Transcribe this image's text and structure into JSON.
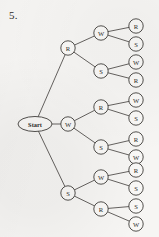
{
  "problem": {
    "number": "5."
  },
  "diagram": {
    "type": "probability-tree",
    "root": {
      "label": "Start",
      "shape": "ellipse",
      "cx": 35,
      "cy": 124,
      "rx": 17,
      "ry": 7.5
    },
    "node_radius": 7.2,
    "levels": [
      {
        "name": "level-1",
        "nodes": [
          {
            "id": "l1-r",
            "label": "R",
            "cx": 68,
            "cy": 48
          },
          {
            "id": "l1-w",
            "label": "W",
            "cx": 68,
            "cy": 124
          },
          {
            "id": "l1-s",
            "label": "S",
            "cx": 68,
            "cy": 193
          }
        ]
      },
      {
        "name": "level-2",
        "nodes": [
          {
            "id": "l2-a",
            "label": "W",
            "cx": 101,
            "cy": 33,
            "parent": "l1-r"
          },
          {
            "id": "l2-b",
            "label": "S",
            "cx": 101,
            "cy": 71,
            "parent": "l1-r"
          },
          {
            "id": "l2-c",
            "label": "R",
            "cx": 101,
            "cy": 107,
            "parent": "l1-w"
          },
          {
            "id": "l2-d",
            "label": "S",
            "cx": 101,
            "cy": 147,
            "parent": "l1-w"
          },
          {
            "id": "l2-e",
            "label": "W",
            "cx": 101,
            "cy": 177,
            "parent": "l1-s"
          },
          {
            "id": "l2-f",
            "label": "R",
            "cx": 101,
            "cy": 209,
            "parent": "l1-s"
          }
        ]
      },
      {
        "name": "level-3",
        "nodes": [
          {
            "id": "l3-01",
            "label": "R",
            "cx": 136,
            "cy": 26,
            "parent": "l2-a"
          },
          {
            "id": "l3-02",
            "label": "S",
            "cx": 136,
            "cy": 44,
            "parent": "l2-a"
          },
          {
            "id": "l3-03",
            "label": "W",
            "cx": 136,
            "cy": 62,
            "parent": "l2-b"
          },
          {
            "id": "l3-04",
            "label": "R",
            "cx": 136,
            "cy": 80,
            "parent": "l2-b"
          },
          {
            "id": "l3-05",
            "label": "W",
            "cx": 136,
            "cy": 100,
            "parent": "l2-c"
          },
          {
            "id": "l3-06",
            "label": "S",
            "cx": 136,
            "cy": 118,
            "parent": "l2-c"
          },
          {
            "id": "l3-07",
            "label": "R",
            "cx": 136,
            "cy": 139,
            "parent": "l2-d"
          },
          {
            "id": "l3-08",
            "label": "W",
            "cx": 136,
            "cy": 157,
            "parent": "l2-d"
          },
          {
            "id": "l3-09",
            "label": "R",
            "cx": 136,
            "cy": 170,
            "parent": "l2-e"
          },
          {
            "id": "l3-10",
            "label": "S",
            "cx": 136,
            "cy": 188,
            "parent": "l2-e"
          },
          {
            "id": "l3-11",
            "label": "S",
            "cx": 136,
            "cy": 206,
            "parent": "l2-f"
          },
          {
            "id": "l3-12",
            "label": "W",
            "cx": 136,
            "cy": 224,
            "parent": "l2-f"
          }
        ]
      }
    ],
    "colors": {
      "page_background": "#f6f5f3",
      "ink": "#3f3d3a",
      "edge": "#4a4744",
      "node_fill": "#f9f8f6"
    }
  }
}
